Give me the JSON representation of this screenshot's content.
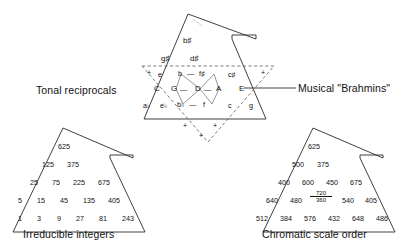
{
  "figure": {
    "left_caption": "Tonal reciprocals",
    "right_caption": "Musical \"Brahmins\"",
    "bottom_left_caption": "Irreducible integers",
    "bottom_right_caption": "Chromatic scale order"
  },
  "star": {
    "apex_note": "b♯",
    "upper_row": [
      "g♯",
      "d♯"
    ],
    "outer_left_upper": "e",
    "outer_left_mid": "C",
    "outer_left_low1": "a♭",
    "outer_left_low2": "e♭",
    "outer_right_upper": "c♯",
    "outer_right_mid": "E",
    "outer_right_low1": "c",
    "outer_right_low2": "g",
    "lattice": {
      "row_top": [
        "b",
        "f♯"
      ],
      "row_mid": [
        "G",
        "D",
        "A"
      ],
      "row_bot": [
        "b♭",
        "f"
      ]
    },
    "plus_marks": [
      "+",
      "+",
      "+",
      "+",
      "+"
    ],
    "dash_connector": "—"
  },
  "integer_triangle": {
    "caption": "Irreducible integers",
    "rows": [
      [
        "625"
      ],
      [
        "125",
        "375"
      ],
      [
        "25",
        "75",
        "225",
        "675"
      ],
      [
        "5",
        "15",
        "45",
        "135",
        "405"
      ],
      [
        "1",
        "3",
        "9",
        "27",
        "81",
        "243"
      ]
    ]
  },
  "chromatic_triangle": {
    "caption": "Chromatic scale order",
    "rows": [
      [
        "625"
      ],
      [
        "500",
        "375"
      ],
      [
        "400",
        "600",
        "450",
        "675"
      ],
      [
        "640",
        "480",
        "FRACTION",
        "540",
        "405"
      ],
      [
        "512",
        "384",
        "576",
        "432",
        "648",
        "486"
      ]
    ],
    "fraction": {
      "numerator": "720",
      "denominator": "360"
    }
  },
  "colors": {
    "ink": "#111111",
    "line": "#2b2b2b",
    "background": "#ffffff"
  }
}
